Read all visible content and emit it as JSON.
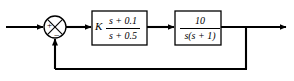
{
  "diagram": {
    "type": "control-system-block-diagram",
    "background_color": "#ffffff",
    "line_color": "#000000",
    "summing_junction": {
      "name": "summing-junction",
      "shape": "circle-with-x",
      "input_sign": "+",
      "feedback_sign": "−",
      "center_x": 55,
      "center_y": 27,
      "radius": 11
    },
    "blocks": [
      {
        "name": "compensator-block",
        "gain_label": "K",
        "numerator": "s + 0.1",
        "denominator": "s + 0.5",
        "x": 92,
        "y": 11,
        "width": 55,
        "height": 34
      },
      {
        "name": "plant-block",
        "gain_label": "",
        "numerator": "10",
        "denominator": "s(s + 1)",
        "x": 175,
        "y": 11,
        "width": 46,
        "height": 34
      }
    ],
    "signals": {
      "input_label": "",
      "output_label": "",
      "feedback_label": ""
    }
  }
}
